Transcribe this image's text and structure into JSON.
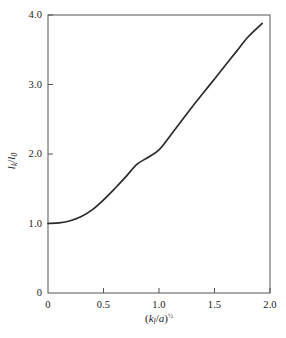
{
  "chart_data": {
    "type": "line",
    "title": "",
    "subtitle": "",
    "xlabel": "(k_l/a)^(1/2)",
    "ylabel": "l_k/l_0",
    "xlabel_parts": {
      "open": "(",
      "var1": "k",
      "sub1": "l",
      "slash": "/",
      "var2": "a",
      "close": ")",
      "exponent": "½"
    },
    "ylabel_parts": {
      "var1": "l",
      "sub1": "k",
      "slash": "/",
      "var2": "l",
      "sub2": "0"
    },
    "xlim": [
      0,
      2.0
    ],
    "ylim": [
      0,
      4.0
    ],
    "xticks": [
      "0",
      "0.5",
      "1.0",
      "1.5",
      "2.0"
    ],
    "xtick_values": [
      0,
      0.5,
      1.0,
      1.5,
      2.0
    ],
    "yticks": [
      "0",
      "1.0",
      "2.0",
      "3.0",
      "4.0"
    ],
    "ytick_values": [
      0,
      1.0,
      2.0,
      3.0,
      4.0
    ],
    "grid": false,
    "legend": false,
    "legend_position": "none",
    "line_color": "#2b2b2b",
    "frame_color": "#555555",
    "background_color": "#ffffff",
    "series": [
      {
        "name": "lk/l0",
        "x": [
          0.0,
          0.1,
          0.2,
          0.3,
          0.4,
          0.5,
          0.6,
          0.7,
          0.8,
          0.9,
          1.0,
          1.1,
          1.2,
          1.3,
          1.4,
          1.5,
          1.6,
          1.7,
          1.8,
          1.93
        ],
        "values": [
          1.0,
          1.01,
          1.04,
          1.1,
          1.2,
          1.34,
          1.5,
          1.67,
          1.85,
          1.95,
          2.06,
          2.26,
          2.47,
          2.68,
          2.88,
          3.08,
          3.28,
          3.48,
          3.68,
          3.88
        ]
      }
    ]
  },
  "figure": {
    "plot_area": {
      "left_px": 48,
      "top_px": 15,
      "right_px": 270,
      "bottom_px": 293
    }
  }
}
